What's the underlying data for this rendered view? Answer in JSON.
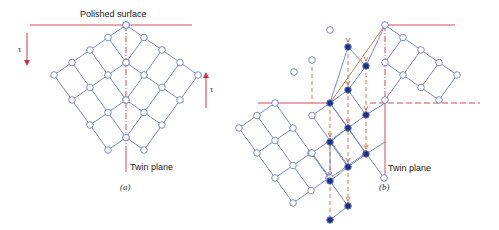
{
  "colors": {
    "lattice": "#6d7fc0",
    "red": "#c8374a",
    "dashed": "#d0683a",
    "node_fill_open": "#ffffff",
    "node_fill_solid": "#1f2f86"
  },
  "panel_a": {
    "surface_label": "Polished surface",
    "twin_label": "Twin plane",
    "caption": "(a)",
    "tau_left": "τ",
    "tau_right": "τ",
    "origin": [
      126,
      25
    ],
    "u": [
      -18,
      12.5
    ],
    "v": [
      18,
      12.5
    ],
    "rows": 5,
    "cols": 5
  },
  "panel_b": {
    "twin_label": "Twin plane",
    "caption": "(b)",
    "origin": [
      385,
      25
    ],
    "u": [
      -18,
      12.5
    ],
    "v": [
      18,
      12.5
    ]
  }
}
